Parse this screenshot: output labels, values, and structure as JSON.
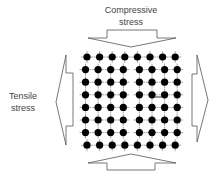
{
  "diagram": {
    "labels": {
      "compressive_line1": "Compressive",
      "compressive_line2": "stress",
      "tensile_line1": "Tensile",
      "tensile_line2": "stress"
    },
    "arrows": [
      {
        "name": "top-compressive-arrow",
        "direction": "down"
      },
      {
        "name": "bottom-compressive-arrow",
        "direction": "up"
      },
      {
        "name": "left-tensile-arrow",
        "direction": "left"
      },
      {
        "name": "right-tensile-arrow",
        "direction": "right"
      }
    ],
    "lattice": {
      "rows": 8,
      "columns": 8,
      "feature": "edge dislocation",
      "colors": {
        "atom": "#000000",
        "bond": "#aaaaaa",
        "arrow_stroke": "#555555"
      }
    }
  }
}
